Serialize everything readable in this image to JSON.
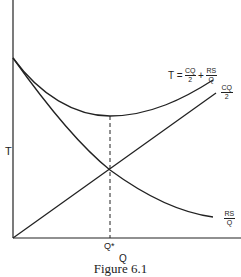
{
  "figure": {
    "caption": "Figure 6.1",
    "y_axis_label": "T",
    "x_axis_label": "Q",
    "x_marker_label": "Q*",
    "curves": {
      "total": {
        "lhs": "T =",
        "term1_num": "CQ",
        "term1_den": "2",
        "plus": "+",
        "term2_num": "RS",
        "term2_den": "Q"
      },
      "holding": {
        "num": "CQ",
        "den": "2"
      },
      "ordering": {
        "num": "RS",
        "den": "Q"
      }
    },
    "colors": {
      "line": "#222222",
      "background": "#ffffff"
    }
  }
}
